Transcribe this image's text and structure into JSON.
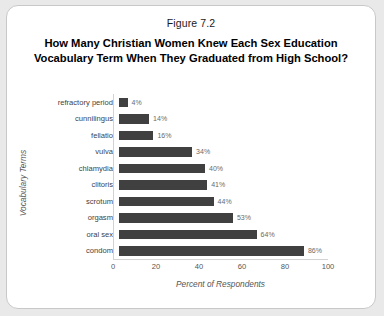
{
  "figure": {
    "caption": "Figure 7.2",
    "title_line1": "How Many Christian Women Knew Each Sex Education",
    "title_line2": "Vocabulary Term When They Graduated from High School?"
  },
  "colors": {
    "bar": "#404040",
    "card_background": "#ffffff",
    "page_background": "#e9e9e9",
    "axis_line": "#d2d2d2",
    "label_text": "#3f3f3f",
    "value_text": "#6a6a6a"
  },
  "chart_data": {
    "type": "bar",
    "orientation": "horizontal",
    "title": "How Many Christian Women Knew Each Sex Education Vocabulary Term When They Graduated from High School?",
    "subtitle": "Figure 7.2",
    "xlabel": "Percent of Respondents",
    "ylabel": "Vocabulary Terms",
    "xlim": [
      0,
      100
    ],
    "xticks": [
      0,
      20,
      40,
      60,
      80,
      100
    ],
    "grid": false,
    "legend": false,
    "categories": [
      "refractory period",
      "cunnilingus",
      "fellatio",
      "vulva",
      "chlamydia",
      "clitoris",
      "scrotum",
      "orgasm",
      "oral sex",
      "condom"
    ],
    "values": [
      4,
      14,
      16,
      34,
      40,
      41,
      44,
      53,
      64,
      86
    ],
    "data_labels": [
      "4%",
      "14%",
      "16%",
      "34%",
      "40%",
      "41%",
      "44%",
      "53%",
      "64%",
      "86%"
    ]
  }
}
